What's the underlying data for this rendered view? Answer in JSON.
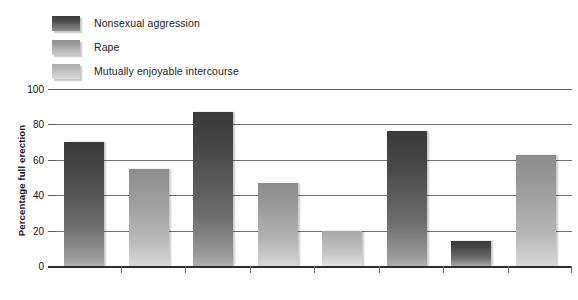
{
  "chart_data": {
    "type": "bar",
    "title": "",
    "xlabel": "",
    "ylabel": "Percentage full erection",
    "ylim": [
      0,
      100
    ],
    "yticks": [
      0,
      20,
      40,
      60,
      80,
      100
    ],
    "grid": true,
    "legend_position": "top-left",
    "series": [
      {
        "name": "Nonsexual aggression",
        "color": "#3a3a3a",
        "values": [
          70,
          87,
          76,
          14
        ]
      },
      {
        "name": "Rape",
        "color": "#8d8d8d",
        "values": [
          55,
          47,
          63
        ]
      },
      {
        "name": "Mutually enjoyable intercourse",
        "color": "#a8a8a8",
        "values": [
          20
        ]
      }
    ],
    "bars": [
      {
        "value": 70,
        "series": 0,
        "series_name": "Nonsexual aggression"
      },
      {
        "value": 55,
        "series": 1,
        "series_name": "Rape"
      },
      {
        "value": 87,
        "series": 0,
        "series_name": "Nonsexual aggression"
      },
      {
        "value": 47,
        "series": 1,
        "series_name": "Rape"
      },
      {
        "value": 20,
        "series": 2,
        "series_name": "Mutually enjoyable intercourse"
      },
      {
        "value": 76,
        "series": 0,
        "series_name": "Nonsexual aggression"
      },
      {
        "value": 14,
        "series": 0,
        "series_name": "Nonsexual aggression"
      },
      {
        "value": 63,
        "series": 1,
        "series_name": "Rape"
      }
    ]
  },
  "legend": {
    "items": [
      {
        "label": "Nonsexual aggression",
        "swatch": "legend-swatch-nonsexual-aggression"
      },
      {
        "label": "Rape",
        "swatch": "legend-swatch-rape"
      },
      {
        "label": "Mutually enjoyable intercourse",
        "swatch": "legend-swatch-mutually-enjoyable-intercourse"
      }
    ]
  },
  "axis": {
    "y_title": "Percentage full erection",
    "y_tick_labels": [
      "100",
      "80",
      "60",
      "40",
      "20",
      "0"
    ]
  }
}
